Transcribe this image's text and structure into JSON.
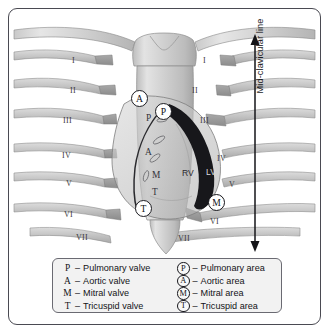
{
  "figure": {
    "background_color": "#ffffff",
    "frame_color": "#4a4a52"
  },
  "annotation": {
    "mid_clavicular_label": "Mid-clavicular line",
    "arrow_name": "mid-clavicular-line-arrow"
  },
  "ribs": {
    "left": [
      {
        "label": "I",
        "x": 72,
        "y": 56
      },
      {
        "label": "II",
        "x": 70,
        "y": 86
      },
      {
        "label": "III",
        "x": 63,
        "y": 116
      },
      {
        "label": "IV",
        "x": 62,
        "y": 151
      },
      {
        "label": "V",
        "x": 66,
        "y": 179
      },
      {
        "label": "VI",
        "x": 64,
        "y": 210
      },
      {
        "label": "VII",
        "x": 76,
        "y": 233
      }
    ],
    "right": [
      {
        "label": "I",
        "x": 203,
        "y": 56
      },
      {
        "label": "II",
        "x": 192,
        "y": 86
      },
      {
        "label": "III",
        "x": 200,
        "y": 116
      },
      {
        "label": "IV",
        "x": 217,
        "y": 154
      },
      {
        "label": "V",
        "x": 229,
        "y": 180
      },
      {
        "label": "VI",
        "x": 210,
        "y": 217
      },
      {
        "label": "VII",
        "x": 178,
        "y": 234
      }
    ]
  },
  "chambers": [
    {
      "label": "RV",
      "x": 182,
      "y": 168,
      "on_dark": false
    },
    {
      "label": "LV",
      "x": 206,
      "y": 167,
      "on_dark": true
    }
  ],
  "valve_letters": [
    {
      "label": "P",
      "x": 146,
      "y": 113
    },
    {
      "label": "A",
      "x": 145,
      "y": 147
    },
    {
      "label": "M",
      "x": 152,
      "y": 170
    },
    {
      "label": "T",
      "x": 152,
      "y": 187
    }
  ],
  "area_markers": [
    {
      "label": "A",
      "name": "aortic-area-marker",
      "x": 131,
      "y": 90,
      "on_dark": false
    },
    {
      "label": "P",
      "name": "pulmonary-area-marker",
      "x": 155,
      "y": 103,
      "on_dark": false
    },
    {
      "label": "M",
      "name": "mitral-area-marker",
      "x": 208,
      "y": 194,
      "on_dark": true
    },
    {
      "label": "T",
      "name": "tricuspid-area-marker",
      "x": 135,
      "y": 200,
      "on_dark": false
    }
  ],
  "legend": {
    "valves": [
      {
        "key": "P",
        "dash": "–",
        "text": "Pulmonary valve"
      },
      {
        "key": "A",
        "dash": "–",
        "text": "Aortic valve"
      },
      {
        "key": "M",
        "dash": "–",
        "text": "Mitral valve"
      },
      {
        "key": "T",
        "dash": "–",
        "text": "Tricuspid valve"
      }
    ],
    "areas": [
      {
        "key": "P",
        "dash": "–",
        "text": "Pulmonary area"
      },
      {
        "key": "A",
        "dash": "–",
        "text": "Aortic area"
      },
      {
        "key": "M",
        "dash": "–",
        "text": "Mitral area"
      },
      {
        "key": "T",
        "dash": "–",
        "text": "Tricuspid area"
      }
    ]
  }
}
